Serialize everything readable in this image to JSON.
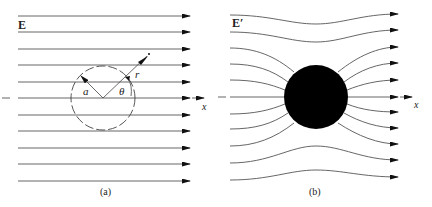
{
  "figure": {
    "panels": [
      {
        "id": "a",
        "caption": "(a)",
        "field_label": "E",
        "axis_label": "x",
        "radius_label": "a",
        "distance_label": "r",
        "angle_label": "θ",
        "description": "Uniform electric field E with dashed circle of radius a centered on x-axis; position vector r at angle θ"
      },
      {
        "id": "b",
        "caption": "(b)",
        "field_label": "E′",
        "axis_label": "x",
        "description": "Field lines E′ distorted around a solid (conducting) sphere"
      }
    ],
    "colors": {
      "line": "#555555",
      "arrow": "#111111",
      "sphere": "#000000",
      "background": "#ffffff"
    }
  }
}
